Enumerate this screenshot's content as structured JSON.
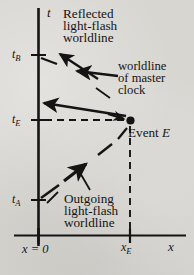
{
  "figure": {
    "kind": "spacetime-diagram",
    "axes": {
      "time_axis_label": "t",
      "space_axis_label": "x",
      "origin_label": "x = 0",
      "event_x_label": "x",
      "event_x_sub": "E"
    },
    "time_ticks": [
      {
        "name": "tB",
        "label": "t",
        "sub": "B"
      },
      {
        "name": "tE",
        "label": "t",
        "sub": "E"
      },
      {
        "name": "tA",
        "label": "t",
        "sub": "A"
      }
    ],
    "annotations": {
      "reflected": {
        "lines": [
          "Reflected",
          "light-flash",
          "worldline"
        ]
      },
      "master_clock": {
        "lines": [
          "worldline",
          "of master",
          "clock"
        ]
      },
      "outgoing": {
        "lines": [
          "Outgoing",
          "light-flash",
          "worldline"
        ]
      },
      "event": {
        "text": "Event ",
        "italic": "E"
      }
    },
    "colors": {
      "ink": "#141414",
      "background": "#d8d6d1"
    }
  }
}
